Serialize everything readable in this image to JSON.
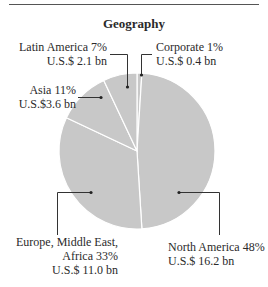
{
  "chart_data": {
    "type": "pie",
    "title": "Geography",
    "start_angle_deg": 0,
    "direction": "clockwise",
    "slice_color": "#c8c8c8",
    "border_color": "#ffffff",
    "slices": [
      {
        "name": "Corporate",
        "percent": 1,
        "value_label": "U.S.$ 0.4 bn",
        "value_bn": 0.4
      },
      {
        "name": "North America",
        "percent": 48,
        "value_label": "U.S.$ 16.2 bn",
        "value_bn": 16.2
      },
      {
        "name": "Europe, Middle East, Africa",
        "percent": 33,
        "value_label": "U.S.$ 11.0 bn",
        "value_bn": 11.0
      },
      {
        "name": "Asia",
        "percent": 11,
        "value_label": "U.S.$3.6 bn",
        "value_bn": 3.6
      },
      {
        "name": "Latin America",
        "percent": 7,
        "value_label": "U.S.$ 2.1 bn",
        "value_bn": 2.1
      }
    ]
  },
  "labels": {
    "latam_line1": "Latin America  7%",
    "latam_line2": "U.S.$ 2.1 bn",
    "corporate_line1": "Corporate  1%",
    "corporate_line2": "U.S.$ 0.4 bn",
    "asia_line1": "Asia  11%",
    "asia_line2": "U.S.$3.6 bn",
    "emea_line1": "Europe, Middle East,",
    "emea_line2": "Africa  33%",
    "emea_line3": "U.S.$ 11.0 bn",
    "na_line1": "North America  48%",
    "na_line2": "U.S.$ 16.2 bn"
  }
}
